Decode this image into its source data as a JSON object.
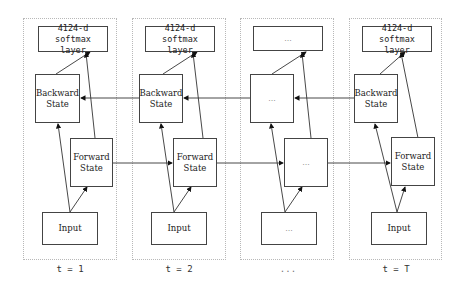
{
  "diagram": {
    "type": "bidirectional-rnn-unrolled",
    "timesteps": [
      {
        "label": "t = 1",
        "softmax": "4124-d softmax\nlayer",
        "backward": "Backward\nState",
        "forward": "Forward\nState",
        "input": "Input"
      },
      {
        "label": "t = 2",
        "softmax": "4124-d softmax\nlayer",
        "backward": "Backward\nState",
        "forward": "Forward\nState",
        "input": "Input"
      },
      {
        "label": "...",
        "softmax": "...",
        "backward": "...",
        "forward": "...",
        "input": "..."
      },
      {
        "label": "t = T",
        "softmax": "4124-d softmax\nlayer",
        "backward": "Backward\nState",
        "forward": "Forward\nState",
        "input": "Input"
      }
    ],
    "edges": [
      "Input -> Forward State",
      "Input -> Backward State",
      "Forward State -> softmax layer",
      "Backward State -> softmax layer",
      "Forward State(t) -> Forward State(t+1)",
      "Backward State(t+1) -> Backward State(t)"
    ]
  }
}
